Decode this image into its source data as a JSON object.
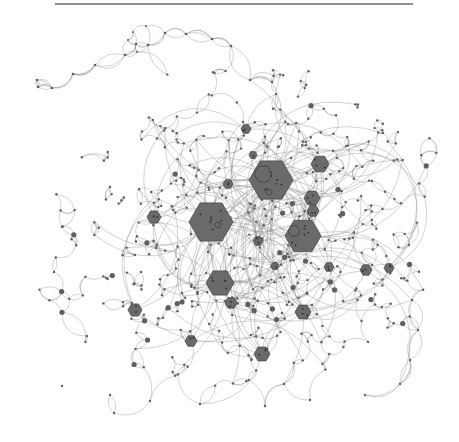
{
  "figure": {
    "type": "network-graph",
    "colors": {
      "background": "#ffffff",
      "edge": "#8a8a8a",
      "node": "#5f5f5f",
      "hub_fill": "#6a6a6a",
      "hub_stroke": "#4a4a4a",
      "rule": "#6b6b6b"
    },
    "top_rule": {
      "x1": 55,
      "x2": 413,
      "y": 4
    },
    "hubs": [
      {
        "x": 271,
        "y": 180,
        "r": 22,
        "inner": [
          {
            "dx": -8,
            "dy": -6,
            "r": 9
          },
          {
            "dx": -2,
            "dy": 12,
            "r": 3
          }
        ]
      },
      {
        "x": 211,
        "y": 222,
        "r": 22,
        "inner": [
          {
            "dx": 7,
            "dy": 3,
            "r": 3
          }
        ]
      },
      {
        "x": 303,
        "y": 236,
        "r": 18,
        "inner": [
          {
            "dx": -9,
            "dy": -5,
            "r": 6
          }
        ]
      },
      {
        "x": 220,
        "y": 283,
        "r": 14,
        "inner": []
      },
      {
        "x": 320,
        "y": 164,
        "r": 9,
        "inner": []
      },
      {
        "x": 312,
        "y": 198,
        "r": 8,
        "inner": []
      },
      {
        "x": 313,
        "y": 211,
        "r": 6,
        "inner": []
      },
      {
        "x": 154,
        "y": 217,
        "r": 7,
        "inner": []
      },
      {
        "x": 262,
        "y": 354,
        "r": 8,
        "inner": []
      },
      {
        "x": 303,
        "y": 312,
        "r": 8,
        "inner": []
      },
      {
        "x": 231,
        "y": 303,
        "r": 6,
        "inner": []
      },
      {
        "x": 135,
        "y": 310,
        "r": 7,
        "inner": []
      },
      {
        "x": 191,
        "y": 341,
        "r": 6,
        "inner": []
      },
      {
        "x": 246,
        "y": 129,
        "r": 5,
        "inner": []
      },
      {
        "x": 228,
        "y": 184,
        "r": 5,
        "inner": []
      },
      {
        "x": 258,
        "y": 241,
        "r": 5,
        "inner": []
      },
      {
        "x": 366,
        "y": 270,
        "r": 6,
        "inner": []
      },
      {
        "x": 329,
        "y": 267,
        "r": 5,
        "inner": []
      },
      {
        "x": 389,
        "y": 268,
        "r": 5,
        "inner": []
      },
      {
        "x": 253,
        "y": 155,
        "r": 4,
        "inner": []
      },
      {
        "x": 275,
        "y": 266,
        "r": 4,
        "inner": []
      }
    ],
    "seed": 7,
    "small_node_count": 520,
    "edge_count": 1150
  }
}
